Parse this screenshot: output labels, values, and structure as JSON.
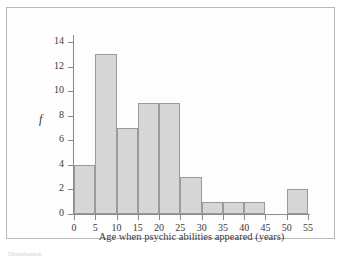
{
  "chart_data": {
    "type": "bar",
    "title": "",
    "subtitle": "",
    "xlabel": "Age when psychic abilities appeared (years)",
    "ylabel": "f",
    "grid": false,
    "legend": false,
    "xlim": [
      0,
      55
    ],
    "ylim": [
      0,
      14
    ],
    "bin_width": 5,
    "x_ticks": [
      "0",
      "5",
      "10",
      "15",
      "20",
      "25",
      "30",
      "35",
      "40",
      "45",
      "50",
      "55"
    ],
    "y_ticks": [
      "0",
      "2",
      "4",
      "6",
      "8",
      "10",
      "12",
      "14"
    ],
    "categories": [
      "0-5",
      "5-10",
      "10-15",
      "15-20",
      "20-25",
      "25-30",
      "30-35",
      "35-40",
      "40-45",
      "45-50",
      "50-55"
    ],
    "bin_starts": [
      0,
      5,
      10,
      15,
      20,
      25,
      30,
      35,
      40,
      45,
      50
    ],
    "values": [
      4,
      13,
      7,
      9,
      9,
      3,
      1,
      1,
      1,
      0,
      2
    ],
    "bar_fill_color": "#d6d6d6",
    "bar_edge_color": "#9a9a9a",
    "axis_color": "#8a8a8a"
  },
  "figure": {
    "frame_color": "#b9b9b9",
    "background_color": "#fdfdfd",
    "caption_fragment": "Distribution"
  }
}
